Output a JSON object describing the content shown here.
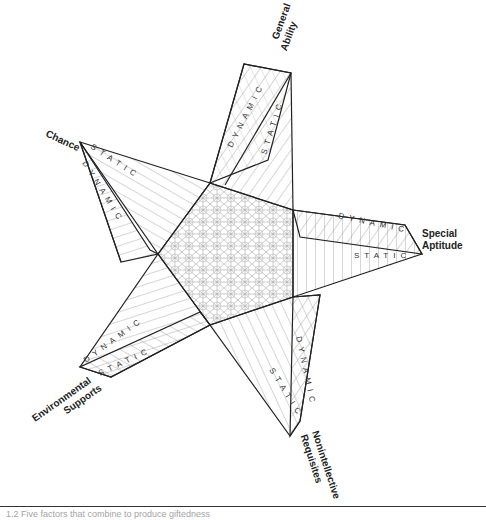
{
  "diagram": {
    "type": "star",
    "center_label": "",
    "points": [
      {
        "id": "general-ability",
        "label_lines": [
          "General",
          "Ability"
        ],
        "bands": [
          "DYNAMIC",
          "STATIC"
        ]
      },
      {
        "id": "special-aptitude",
        "label_lines": [
          "Special",
          "Aptitude"
        ],
        "bands": [
          "DYNAMIC",
          "STATIC"
        ]
      },
      {
        "id": "nonintellective-requisites",
        "label_lines": [
          "Nonintellective",
          "Requisites"
        ],
        "bands": [
          "DYNAMIC",
          "STATIC"
        ]
      },
      {
        "id": "environmental-supports",
        "label_lines": [
          "Environmental",
          "Supports"
        ],
        "bands": [
          "DYNAMIC",
          "STATIC"
        ]
      },
      {
        "id": "chance",
        "label_lines": [
          "Chance"
        ],
        "bands": [
          "STATIC",
          "DYNAMIC"
        ]
      }
    ],
    "colors": {
      "line": "#222222",
      "hatch": "#888888",
      "background": "#ffffff"
    }
  },
  "caption": {
    "text": "1.2  Five factors that combine to produce giftedness"
  }
}
